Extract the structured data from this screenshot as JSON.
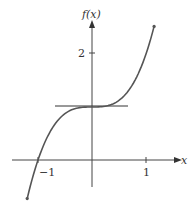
{
  "chart_data": {
    "type": "line",
    "title": "",
    "function": "f(x) = x^3 + 1",
    "xlabel": "x",
    "ylabel": "f(x)",
    "x_ticks": [
      {
        "value": -1,
        "label": "-1"
      },
      {
        "value": 1,
        "label": "1"
      }
    ],
    "y_ticks": [
      {
        "value": 2,
        "label": "2"
      }
    ],
    "xlim": [
      -1.2,
      1.15
    ],
    "ylim": [
      -0.6,
      2.6
    ],
    "grid": false,
    "legend": null,
    "series": [
      {
        "name": "f(x)",
        "x": [
          -1.2,
          -1.0,
          -0.8,
          -0.6,
          -0.4,
          -0.2,
          0,
          0.2,
          0.4,
          0.6,
          0.8,
          1.0,
          1.15
        ],
        "values": [
          -0.728,
          0,
          0.488,
          0.784,
          0.936,
          0.992,
          1,
          1.008,
          1.064,
          1.216,
          1.512,
          2,
          2.52
        ]
      }
    ],
    "annotations": [
      {
        "type": "horizontal_tangent_line",
        "y": 1,
        "x_from": -0.68,
        "x_to": 0.67,
        "label": ""
      }
    ]
  },
  "labels": {
    "y_axis": "f(x)",
    "x_axis": "x",
    "tick_neg1": "−1",
    "tick_1": "1",
    "tick_2": "2"
  }
}
